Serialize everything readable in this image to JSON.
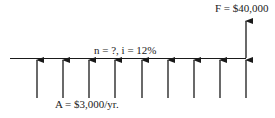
{
  "diagram": {
    "type": "cash-flow-diagram",
    "future_value_label": "F = $40,000",
    "period_label": "n = ?, i = 12%",
    "annuity_label": "A = $3,000/yr.",
    "annuity_arrow_count": 9,
    "colors": {
      "line": "#1a1a1a",
      "background": "#ffffff"
    }
  }
}
